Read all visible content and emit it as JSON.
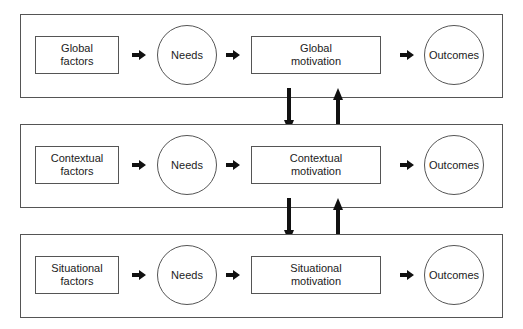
{
  "levels": [
    {
      "name": "global",
      "factors": "Global\nfactors",
      "needs": "Needs",
      "motivation": "Global\nmotivation",
      "outcomes": "Outcomes"
    },
    {
      "name": "contextual",
      "factors": "Contextual\nfactors",
      "needs": "Needs",
      "motivation": "Contextual\nmotivation",
      "outcomes": "Outcomes"
    },
    {
      "name": "situational",
      "factors": "Situational\nfactors",
      "needs": "Needs",
      "motivation": "Situational\nmotivation",
      "outcomes": "Outcomes"
    }
  ],
  "colors": {
    "line": "#555555",
    "arrow": "#111111",
    "background": "#ffffff"
  }
}
